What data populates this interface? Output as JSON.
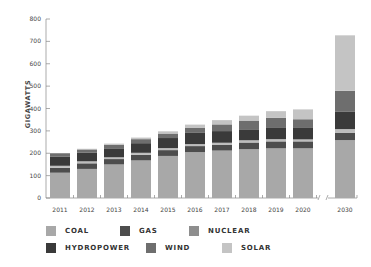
{
  "chart_data": {
    "type": "bar",
    "stacked": true,
    "title": "",
    "xlabel": "",
    "ylabel": "GIGAWATTS",
    "ylim": [
      0,
      800
    ],
    "yticks": [
      0,
      100,
      200,
      300,
      400,
      500,
      600,
      700,
      800
    ],
    "grid": false,
    "legend_position": "bottom",
    "axis_break_between": [
      "2020",
      "2030"
    ],
    "categories": [
      "2011",
      "2012",
      "2013",
      "2014",
      "2015",
      "2016",
      "2017",
      "2018",
      "2019",
      "2020",
      "2030"
    ],
    "series": [
      {
        "name": "COAL",
        "color": "#a8a8a8",
        "values": [
          113,
          130,
          150,
          168,
          188,
          205,
          212,
          218,
          222,
          222,
          259
        ]
      },
      {
        "name": "GAS",
        "color": "#4d4d4d",
        "values": [
          22,
          25,
          24,
          25,
          26,
          27,
          25,
          30,
          31,
          31,
          33
        ]
      },
      {
        "name": "NUCLEAR",
        "color": "#bdbdbd",
        "values": [
          9,
          9,
          8,
          9,
          9,
          9,
          10,
          10,
          10,
          9,
          16
        ]
      },
      {
        "name": "HYDROPOWER",
        "color": "#3a3a3a",
        "values": [
          40,
          38,
          40,
          43,
          45,
          50,
          52,
          49,
          53,
          54,
          77
        ]
      },
      {
        "name": "WIND",
        "color": "#6e6e6e",
        "values": [
          16,
          15,
          16,
          18,
          20,
          22,
          30,
          39,
          42,
          36,
          94
        ]
      },
      {
        "name": "SOLAR",
        "color": "#c4c4c4",
        "values": [
          0,
          3,
          5,
          7,
          10,
          15,
          19,
          22,
          30,
          44,
          248
        ]
      }
    ]
  },
  "legend": {
    "rows": [
      [
        {
          "label": "COAL",
          "color": "#a8a8a8"
        },
        {
          "label": "GAS",
          "color": "#4d4d4d"
        },
        {
          "label": "NUCLEAR",
          "color": "#8e8e8e"
        }
      ],
      [
        {
          "label": "HYDROPOWER",
          "color": "#3a3a3a"
        },
        {
          "label": "WIND",
          "color": "#6e6e6e"
        },
        {
          "label": "SOLAR",
          "color": "#c4c4c4"
        }
      ]
    ]
  }
}
